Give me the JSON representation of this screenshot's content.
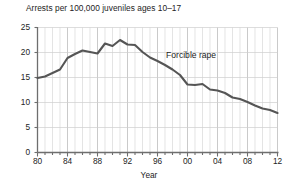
{
  "chart_data": {
    "type": "line",
    "title": "Arrests per 100,000 juveniles ages 10–17",
    "xlabel": "Year",
    "ylabel": "",
    "xlim": [
      1980,
      2012
    ],
    "ylim": [
      0,
      25
    ],
    "grid": true,
    "legend_position": "inline-annotation",
    "annotations": [
      {
        "text": "Forcible rape",
        "x": 1998,
        "y": 18.2
      }
    ],
    "ytick_labels": [
      "0",
      "5",
      "10",
      "15",
      "20",
      "25"
    ],
    "ytick_values": [
      0,
      5,
      10,
      15,
      20,
      25
    ],
    "xtick_labels": [
      "80",
      "84",
      "88",
      "92",
      "96",
      "00",
      "04",
      "08",
      "12"
    ],
    "xtick_values": [
      1980,
      1984,
      1988,
      1992,
      1996,
      2000,
      2004,
      2008,
      2012
    ],
    "line_color": "#555555",
    "grid_color": "#c8c8c8",
    "axis_color": "#6e6e6e",
    "series": [
      {
        "name": "Forcible rape",
        "x": [
          1980,
          1981,
          1982,
          1983,
          1984,
          1985,
          1986,
          1987,
          1988,
          1989,
          1990,
          1991,
          1992,
          1993,
          1994,
          1995,
          1996,
          1997,
          1998,
          1999,
          2000,
          2001,
          2002,
          2003,
          2004,
          2005,
          2006,
          2007,
          2008,
          2009,
          2010,
          2011,
          2012
        ],
        "values": [
          14.9,
          15.2,
          15.9,
          16.6,
          18.9,
          19.7,
          20.4,
          20.1,
          19.8,
          21.8,
          21.3,
          22.5,
          21.6,
          21.5,
          20.1,
          19.0,
          18.3,
          17.5,
          16.6,
          15.5,
          13.6,
          13.5,
          13.7,
          12.6,
          12.4,
          11.9,
          11.0,
          10.7,
          10.1,
          9.4,
          8.8,
          8.5,
          7.9
        ]
      }
    ]
  }
}
